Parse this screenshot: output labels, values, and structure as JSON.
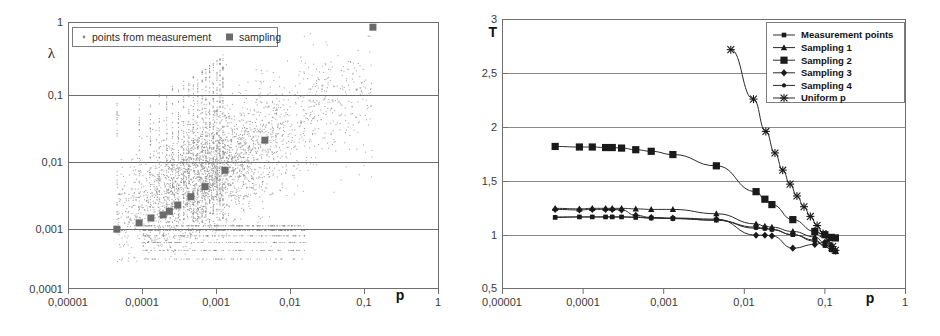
{
  "figure": {
    "panels": [
      "scatter-lambda-vs-p",
      "T-vs-p-curves"
    ]
  },
  "chart_data": [
    {
      "type": "scatter",
      "id": "left",
      "title": "",
      "xlabel": "p",
      "ylabel": "λ",
      "xscale": "log",
      "yscale": "log",
      "xlim": [
        1e-05,
        1
      ],
      "ylim": [
        0.0001,
        1
      ],
      "xticks": [
        1e-05,
        0.0001,
        0.001,
        0.01,
        0.1,
        1
      ],
      "xticklabels": [
        "0,00001",
        "0,0001",
        "0,001",
        "0,01",
        "0,1",
        "1"
      ],
      "yticks": [
        0.0001,
        0.001,
        0.01,
        0.1,
        1
      ],
      "yticklabels": [
        "0,0001",
        "0,001",
        "0,01",
        "0,1",
        "1"
      ],
      "grid": "horizontal",
      "legend_position": "top-left-inside",
      "legend": [
        {
          "label": "points from measurement",
          "marker": "dot",
          "color": "#8a8a8a"
        },
        {
          "label": "sampling",
          "marker": "square",
          "color": "#6b6b6b"
        }
      ],
      "series": [
        {
          "name": "sampling",
          "marker": "square",
          "color": "#6b6b6b",
          "x": [
            4.5e-05,
            9e-05,
            0.00013,
            0.00019,
            0.00023,
            0.0003,
            0.00045,
            0.0007,
            0.0013,
            0.0045,
            0.13
          ],
          "y": [
            0.00078,
            0.00097,
            0.00115,
            0.00128,
            0.00145,
            0.0018,
            0.0024,
            0.0034,
            0.006,
            0.017,
            0.85
          ]
        },
        {
          "name": "points from measurement",
          "marker": "dot",
          "color": "#8a8a8a",
          "description": "dense cloud of several thousand measurement points, column-structured at small p, broad lobe centred near p=0.003, lambda=0.01, rising toward lambda=0.2 at p=0.05"
        }
      ]
    },
    {
      "type": "line",
      "id": "right",
      "title": "",
      "xlabel": "p",
      "ylabel": "T",
      "xscale": "log",
      "yscale": "linear",
      "xlim": [
        1e-05,
        1
      ],
      "ylim": [
        0.5,
        3
      ],
      "xticks": [
        1e-05,
        0.0001,
        0.001,
        0.01,
        0.1,
        1
      ],
      "xticklabels": [
        "0,00001",
        "0,0001",
        "0,001",
        "0,01",
        "0,1",
        "1"
      ],
      "yticks": [
        0.5,
        1,
        1.5,
        2,
        2.5,
        3
      ],
      "yticklabels": [
        "0,5",
        "1",
        "1,5",
        "2",
        "2,5",
        "3"
      ],
      "grid": "horizontal",
      "legend_position": "top-right-inside",
      "series": [
        {
          "name": "Measurement points",
          "marker": "small-square",
          "x": [
            4.5e-05,
            9e-05,
            0.00013,
            0.00019,
            0.00023,
            0.0003,
            0.00045,
            0.0007,
            0.0013,
            0.0045,
            0.014,
            0.018,
            0.022,
            0.04,
            0.075,
            0.1,
            0.12,
            0.135
          ],
          "y": [
            1.16,
            1.165,
            1.165,
            1.165,
            1.165,
            1.165,
            1.16,
            1.155,
            1.15,
            1.135,
            1.07,
            1.06,
            1.05,
            1.0,
            0.95,
            0.9,
            0.86,
            0.84
          ]
        },
        {
          "name": "Sampling 1",
          "marker": "triangle",
          "x": [
            4.5e-05,
            9e-05,
            0.00013,
            0.00019,
            0.00023,
            0.0003,
            0.00045,
            0.0007,
            0.0013,
            0.0045,
            0.014,
            0.018,
            0.022,
            0.04,
            0.075,
            0.1,
            0.12,
            0.135
          ],
          "y": [
            1.245,
            1.24,
            1.245,
            1.245,
            1.245,
            1.245,
            1.24,
            1.235,
            1.235,
            1.195,
            1.1,
            1.08,
            1.07,
            1.03,
            0.98,
            0.92,
            0.87,
            0.845
          ]
        },
        {
          "name": "Sampling 2",
          "marker": "square",
          "x": [
            4.5e-05,
            9e-05,
            0.00013,
            0.00019,
            0.00023,
            0.0003,
            0.00045,
            0.0007,
            0.0013,
            0.0045,
            0.014,
            0.018,
            0.022,
            0.04,
            0.075,
            0.1,
            0.12,
            0.135
          ],
          "y": [
            1.82,
            1.815,
            1.815,
            1.81,
            1.81,
            1.805,
            1.79,
            1.775,
            1.745,
            1.64,
            1.4,
            1.33,
            1.28,
            1.14,
            1.03,
            1.0,
            0.975,
            0.97
          ]
        },
        {
          "name": "Sampling 3",
          "marker": "diamond",
          "x": [
            4.5e-05,
            9e-05,
            0.00013,
            0.00019,
            0.00023,
            0.0003,
            0.00045,
            0.0007,
            0.0013,
            0.0045,
            0.014,
            0.018,
            0.022,
            0.04,
            0.075,
            0.1,
            0.12,
            0.135
          ],
          "y": [
            1.235,
            1.23,
            1.235,
            1.235,
            1.235,
            1.23,
            1.18,
            1.16,
            1.155,
            1.145,
            0.995,
            0.995,
            0.99,
            0.875,
            0.91,
            0.93,
            0.9,
            0.85
          ]
        },
        {
          "name": "Sampling 4",
          "marker": "dot",
          "x": [
            4.5e-05,
            9e-05,
            0.00013,
            0.00019,
            0.00023,
            0.0003,
            0.00045,
            0.0007,
            0.0013,
            0.0045,
            0.014,
            0.018,
            0.022,
            0.04,
            0.075,
            0.1,
            0.12,
            0.135
          ],
          "y": [
            1.165,
            1.165,
            1.165,
            1.165,
            1.165,
            1.165,
            1.165,
            1.155,
            1.15,
            1.135,
            1.06,
            1.055,
            1.045,
            1.0,
            0.94,
            0.895,
            0.855,
            0.84
          ]
        },
        {
          "name": "Uniform p",
          "marker": "cross",
          "x": [
            0.0068,
            0.013,
            0.0185,
            0.024,
            0.03,
            0.037,
            0.045,
            0.055,
            0.066,
            0.08,
            0.095,
            0.11,
            0.125,
            0.135
          ],
          "y": [
            2.72,
            2.26,
            1.96,
            1.76,
            1.6,
            1.47,
            1.36,
            1.26,
            1.17,
            1.085,
            1.01,
            0.945,
            0.89,
            0.855
          ]
        }
      ],
      "legend": [
        {
          "label": "Measurement points",
          "marker": "small-square"
        },
        {
          "label": "Sampling 1",
          "marker": "triangle"
        },
        {
          "label": "Sampling 2",
          "marker": "square"
        },
        {
          "label": "Sampling 3",
          "marker": "diamond"
        },
        {
          "label": "Sampling 4",
          "marker": "dot"
        },
        {
          "label": "Uniform p",
          "marker": "cross"
        }
      ]
    }
  ],
  "left": {
    "ylabel": "λ",
    "xlabel": "p",
    "yticklabels": [
      "1",
      "0,1",
      "0,01",
      "0,001",
      "0,0001"
    ],
    "xticklabels": [
      "0,00001",
      "0,0001",
      "0,001",
      "0,01",
      "0,1",
      "1"
    ],
    "legend": {
      "measurement": "points from measurement",
      "sampling": "sampling"
    }
  },
  "right": {
    "ylabel": "T",
    "xlabel": "p",
    "yticklabels": [
      "3",
      "2,5",
      "2",
      "1,5",
      "1",
      "0,5"
    ],
    "xticklabels": [
      "0,00001",
      "0,0001",
      "0,001",
      "0,01",
      "0,1",
      "1"
    ],
    "legend": {
      "items": [
        "Measurement points",
        "Sampling 1",
        "Sampling 2",
        "Sampling 3",
        "Sampling 4",
        "Uniform p"
      ]
    }
  },
  "colors": {
    "frame": "#6f6f6f",
    "grid": "#6d6d6d",
    "scatter_points": "#8a8a8a",
    "sampling_marker": "#6b6b6b",
    "curve": "#2a2a2a",
    "text": "#2b2b2b"
  }
}
